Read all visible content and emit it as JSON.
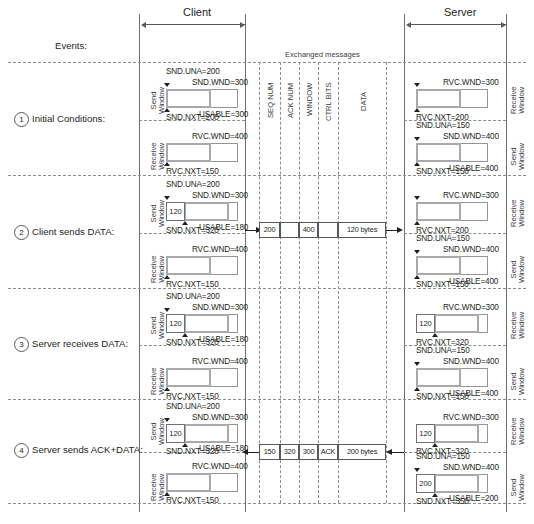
{
  "figure": {
    "events_label": "Events:",
    "exchanged_label": "Exchanged messages"
  },
  "headers": {
    "client": "Client",
    "server": "Server"
  },
  "side_labels": {
    "client_send": "Send\nWindow",
    "client_receive": "Receive\nWindow",
    "server_receive": "Receive\nWindow",
    "server_send": "Send\nWindow"
  },
  "message_columns": [
    {
      "name": "seq-num",
      "label": "SEQ NUM"
    },
    {
      "name": "ack-num",
      "label": "ACK NUM"
    },
    {
      "name": "window",
      "label": "WINDOW"
    },
    {
      "name": "ctrl-bits",
      "label": "CTRL BITS"
    },
    {
      "name": "data",
      "label": "DATA"
    }
  ],
  "rows": [
    {
      "number": "1",
      "event": "Initial Conditions:",
      "client": {
        "send": {
          "una": "SND.UNA=200",
          "wnd": "SND.WND=300",
          "usable": "USABLE=300",
          "nxt": "SND.NXT=200",
          "data": ""
        },
        "receive": {
          "wnd": "RVC.WND=400",
          "nxt": "RVC.NXT=150",
          "data": ""
        }
      },
      "server": {
        "receive": {
          "wnd": "RVC.WND=300",
          "nxt": "RVC.NXT=200",
          "data": ""
        },
        "send": {
          "una": "SND.UNA=150",
          "wnd": "SND.WND=400",
          "usable": "USABLE=400",
          "nxt": "SND.NXT=150",
          "data": ""
        }
      },
      "message": null
    },
    {
      "number": "2",
      "event": "Client sends DATA:",
      "client": {
        "send": {
          "una": "SND.UNA=200",
          "wnd": "SND.WND=300",
          "usable": "USABLE=180",
          "nxt": "SND.NXT=320",
          "data": "120"
        },
        "receive": {
          "wnd": "RVC.WND=400",
          "nxt": "RVC.NXT=150",
          "data": ""
        }
      },
      "server": {
        "receive": {
          "wnd": "RVC.WND=300",
          "nxt": "RVC.NXT=200",
          "data": ""
        },
        "send": {
          "una": "SND.UNA=150",
          "wnd": "SND.WND=400",
          "usable": "USABLE=400",
          "nxt": "SND.NXT=150",
          "data": ""
        }
      },
      "message": {
        "direction": "right",
        "seq_num": "200",
        "ack_num": "",
        "window": "400",
        "ctrl_bits": "",
        "data": "120 bytes"
      }
    },
    {
      "number": "3",
      "event": "Server receives DATA:",
      "client": {
        "send": {
          "una": "SND.UNA=200",
          "wnd": "SND.WND=300",
          "usable": "USABLE=180",
          "nxt": "SND.NXT=320",
          "data": "120"
        },
        "receive": {
          "wnd": "RVC.WND=400",
          "nxt": "RVC.NXT=150",
          "data": ""
        }
      },
      "server": {
        "receive": {
          "wnd": "RVC.WND=300",
          "nxt": "RVC.NXT=320",
          "data": "120"
        },
        "send": {
          "una": "SND.UNA=150",
          "wnd": "SND.WND=400",
          "usable": "USABLE=400",
          "nxt": "SND.NXT=150",
          "data": ""
        }
      },
      "message": null
    },
    {
      "number": "4",
      "event": "Server sends ACK+DATA:",
      "client": {
        "send": {
          "una": "SND.UNA=200",
          "wnd": "SND.WND=300",
          "usable": "USABLE=180",
          "nxt": "SND.NXT=320",
          "data": "120"
        },
        "receive": {
          "wnd": "RVC.WND=400",
          "nxt": "RVC.NXT=150",
          "data": ""
        }
      },
      "server": {
        "receive": {
          "wnd": "RVC.WND=300",
          "nxt": "RVC.NXT=320",
          "data": "120"
        },
        "send": {
          "una": "SND.UNA=150",
          "wnd": "SND.WND=400",
          "usable": "USABLE=200",
          "nxt": "SND.NXT=350",
          "data": "200"
        }
      },
      "message": {
        "direction": "left",
        "seq_num": "150",
        "ack_num": "320",
        "window": "300",
        "ctrl_bits": "ACK",
        "data": "200 bytes"
      }
    }
  ],
  "colors": {
    "window_border": "#a7a9ac",
    "outline": "#939598",
    "text": "#231f20",
    "dash": "#8a8c8e"
  }
}
